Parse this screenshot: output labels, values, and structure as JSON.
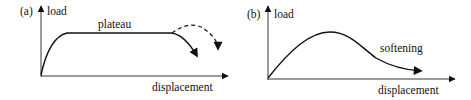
{
  "panels": [
    {
      "tag": "(a)",
      "y_label": "load",
      "x_label": "displacement",
      "annotation": "plateau",
      "curves": [
        "solid rise to plateau then solid downward arrow",
        "dashed alternative arc arrow"
      ]
    },
    {
      "tag": "(b)",
      "y_label": "load",
      "x_label": "displacement",
      "annotation": "softening",
      "curves": [
        "solid rise to peak then softening descent with arrow"
      ]
    }
  ],
  "colors": {
    "line": "#111111",
    "background": "#ffffff"
  }
}
